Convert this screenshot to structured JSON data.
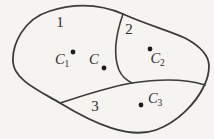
{
  "figure": {
    "type": "region-diagram",
    "description_labels_visible_only": true,
    "background_color": "#f5f4f1",
    "stroke_color": "#3b3b3b",
    "dot_color": "#1c1c1c",
    "text_color": "#2b2b2b",
    "regions": [
      {
        "label": "1"
      },
      {
        "label": "2"
      },
      {
        "label": "3"
      }
    ],
    "points": [
      {
        "name": "C1",
        "label_main": "C",
        "label_sub": "1"
      },
      {
        "name": "C",
        "label_main": "C"
      },
      {
        "name": "C2",
        "label_main": "C",
        "label_sub": "2"
      },
      {
        "name": "C3",
        "label_main": "C",
        "label_sub": "3"
      }
    ]
  }
}
